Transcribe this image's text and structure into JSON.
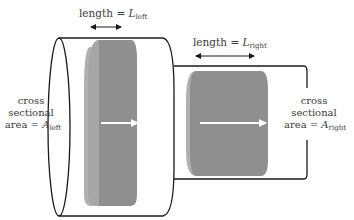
{
  "diagram": {
    "type": "two-cylinder flow tube",
    "colors": {
      "outline": "#1a1a1a",
      "slab_front": "#8f8f8f",
      "slab_side": "#b0b0b0",
      "arrow": "#ffffff",
      "text": "#3a3a3a"
    },
    "left": {
      "length_label": "length = ",
      "length_symbol": "L",
      "length_subscript": "left",
      "area_line1": "cross",
      "area_line2": "sectional",
      "area_line3": "area = ",
      "area_symbol": "A",
      "area_subscript": "left"
    },
    "right": {
      "length_label": "length = ",
      "length_symbol": "L",
      "length_subscript": "right",
      "area_line1": "cross",
      "area_line2": "sectional",
      "area_line3": "area = ",
      "area_symbol": "A",
      "area_subscript": "right"
    }
  }
}
